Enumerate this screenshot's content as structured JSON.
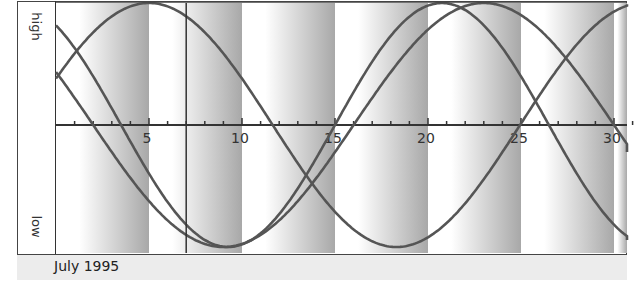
{
  "title": "",
  "labels": {
    "high": "high",
    "low": "low",
    "month": "July 1995"
  },
  "colors": {
    "band_light": "#ffffff",
    "band_dark": "#a8a8a8",
    "curve": "#555555",
    "axis": "#333333",
    "footer_bg": "#ececec"
  },
  "chart_data": {
    "type": "line",
    "title": "",
    "xlabel": "July 1995",
    "ylabel": "low … high",
    "x_ticks": [
      5,
      10,
      15,
      20,
      25,
      30
    ],
    "x_range": [
      0,
      31
    ],
    "y_range": [
      -1,
      1
    ],
    "y_labels": {
      "top": "high",
      "bottom": "low"
    },
    "grid": false,
    "marker_day": 7,
    "shaded_bands_end_days": [
      5,
      10,
      15,
      20,
      25,
      30
    ],
    "series": [
      {
        "name": "cycle-23-day",
        "period": 23,
        "rising_zero_day": 15.0,
        "x": [
          0,
          3.5,
          9.25,
          15,
          20.75,
          26.3,
          31
        ],
        "values": [
          0.82,
          0.0,
          -1.0,
          0.0,
          1.0,
          0.0,
          -0.92
        ]
      },
      {
        "name": "cycle-28-day",
        "period": 28,
        "rising_zero_day": 16.0,
        "x": [
          0,
          2.0,
          9.0,
          16.0,
          23.0,
          31
        ],
        "values": [
          -0.12,
          -0.43,
          -1.0,
          0.0,
          1.0,
          0.28
        ]
      },
      {
        "name": "cycle-26-day",
        "period": 26.6,
        "rising_zero_day": -1.65,
        "x": [
          0,
          5.0,
          11.65,
          18.3,
          24.95,
          31
        ],
        "values": [
          0.38,
          1.0,
          0.0,
          -1.0,
          0.0,
          0.88
        ]
      }
    ]
  }
}
